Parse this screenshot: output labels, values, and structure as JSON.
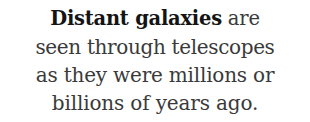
{
  "page": {
    "background_color": "#ffffff",
    "text_color": "#3a3a3a",
    "emphasis_color": "#141414",
    "alignment": "center"
  },
  "caption": {
    "full_text": "Distant galaxies are seen through telescopes as they were millions or billions of years ago.",
    "lines": [
      {
        "emphasis": "Distant galaxies",
        "rest": " are"
      },
      {
        "text": "seen through telescopes"
      },
      {
        "text": "as they were millions or"
      },
      {
        "text": "billions of years ago."
      }
    ]
  }
}
